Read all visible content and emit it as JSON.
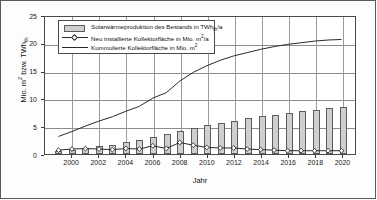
{
  "chart_data": {
    "type": "bar",
    "title": "",
    "xlabel": "Jahr",
    "ylabel": "Mio. m² bzw. TWh_th",
    "ylabel_main": "Mio. m",
    "ylabel_sup1": "2",
    "ylabel_mid": " bzw. TWh",
    "ylabel_sub1": "th",
    "xlim": [
      1998,
      2021
    ],
    "ylim": [
      0,
      25
    ],
    "yticks": [
      0,
      5,
      10,
      15,
      20,
      25
    ],
    "ytick_labels": [
      "0",
      "5",
      "10",
      "15",
      "20",
      "25"
    ],
    "xticks": [
      2000,
      2002,
      2004,
      2006,
      2008,
      2010,
      2012,
      2014,
      2016,
      2018,
      2020
    ],
    "xtick_labels": [
      "2000",
      "2002",
      "2004",
      "2006",
      "2008",
      "2010",
      "2012",
      "2014",
      "2016",
      "2018",
      "2020"
    ],
    "grid": true,
    "legend_position": "upper-left-inside",
    "x": [
      1999,
      2000,
      2001,
      2002,
      2003,
      2004,
      2005,
      2006,
      2007,
      2008,
      2009,
      2010,
      2011,
      2012,
      2013,
      2014,
      2015,
      2016,
      2017,
      2018,
      2019,
      2020
    ],
    "series": [
      {
        "name": "Solarwärmeproduktion des Bestands in TWh_th/a",
        "type": "bar",
        "color": "#cfcfcf",
        "edge_color": "#5d5d5d",
        "values": [
          0.6,
          0.8,
          1.1,
          1.4,
          1.7,
          2.1,
          2.6,
          3.1,
          3.6,
          4.2,
          4.7,
          5.2,
          5.6,
          6.0,
          6.4,
          6.8,
          7.1,
          7.4,
          7.7,
          8.0,
          8.2,
          8.5
        ]
      },
      {
        "name": "Neu installierte Kollektorfläche in Mio. m²/a",
        "type": "line",
        "marker": "diamond",
        "color": "#2a2a2a",
        "values": [
          0.7,
          0.9,
          1.0,
          0.9,
          0.8,
          1.0,
          0.9,
          1.5,
          1.0,
          2.1,
          1.6,
          1.2,
          1.1,
          1.1,
          0.9,
          0.8,
          0.7,
          0.6,
          0.6,
          0.6,
          0.6,
          0.6
        ]
      },
      {
        "name": "Kummulierte Kollektorfläche in Mio. m²",
        "type": "line",
        "marker": "none",
        "color": "#2a2a2a",
        "values": [
          3.2,
          4.1,
          5.1,
          6.0,
          6.8,
          7.8,
          8.7,
          10.2,
          11.2,
          13.3,
          14.9,
          16.1,
          17.1,
          17.9,
          18.5,
          19.1,
          19.6,
          20.0,
          20.3,
          20.6,
          20.8,
          20.9
        ]
      }
    ]
  },
  "legend": {
    "items": [
      {
        "key": "bar",
        "text_main": "Solarwärmeproduktion des Bestands in TWh",
        "text_sub": "th",
        "text_tail": "/a"
      },
      {
        "key": "line-diamond",
        "text_main": "Neu installierte Kollektorfläche in Mio. m",
        "text_sup": "2",
        "text_tail": "/a"
      },
      {
        "key": "line",
        "text_main": "Kummulierte Kollektorfläche in Mio. m",
        "text_sup": "2",
        "text_tail": ""
      }
    ]
  },
  "axes": {
    "x_axis_title": "Jahr",
    "y_axis_title_part1": "Mio. m",
    "y_axis_title_sup": "2",
    "y_axis_title_part2": " bzw. TWh",
    "y_axis_title_sub": "th"
  }
}
